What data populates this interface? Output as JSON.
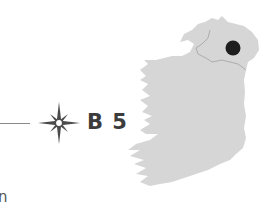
{
  "grid_reference": "B 5",
  "footer_fragment": "n",
  "icons": {
    "compass": "compass-star-icon",
    "location_marker": "location-dot-icon"
  },
  "map": {
    "region": "Ireland",
    "highlighted_region": "Northern Ireland",
    "marker_position": "north-east"
  },
  "colors": {
    "land": "#d6d6d6",
    "border": "#a8a8a8",
    "marker": "#1e1e1e",
    "text": "#3c3c3c",
    "line": "#8a8a8a"
  }
}
